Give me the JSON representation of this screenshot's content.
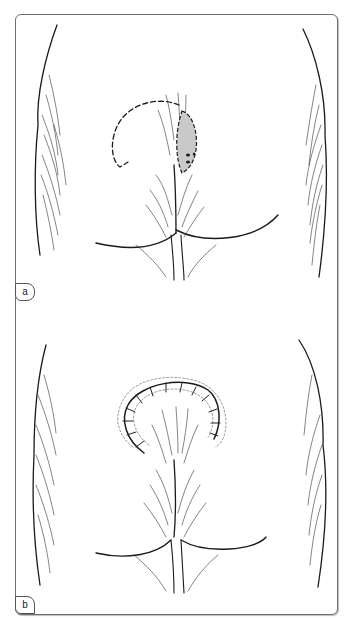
{
  "figure": {
    "panels": [
      {
        "label": "a",
        "description": "Illustration of buttocks with shaded pilonidal sinus lesion and dashed curved incision line for rotation flap"
      },
      {
        "label": "b",
        "description": "Illustration of buttocks after closure showing sutured curved flap incision"
      }
    ]
  },
  "colors": {
    "frame": "#6f6f6f",
    "ink": "#1a1a1a",
    "lesion_fill": "#c9c9c9"
  }
}
